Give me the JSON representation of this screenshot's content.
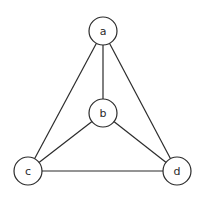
{
  "diagram": {
    "type": "graph",
    "directed": false,
    "nodes": [
      {
        "id": "a",
        "label": "a",
        "x": 103,
        "y": 31
      },
      {
        "id": "b",
        "label": "b",
        "x": 103,
        "y": 113
      },
      {
        "id": "c",
        "label": "c",
        "x": 28,
        "y": 171
      },
      {
        "id": "d",
        "label": "d",
        "x": 177,
        "y": 171
      }
    ],
    "edges": [
      {
        "from": "a",
        "to": "b"
      },
      {
        "from": "a",
        "to": "c"
      },
      {
        "from": "a",
        "to": "d"
      },
      {
        "from": "b",
        "to": "c"
      },
      {
        "from": "b",
        "to": "d"
      },
      {
        "from": "c",
        "to": "d"
      }
    ],
    "node_radius": 14,
    "colors": {
      "stroke": "#2b2b2b",
      "fill": "#ffffff",
      "background": "#ffffff"
    }
  }
}
